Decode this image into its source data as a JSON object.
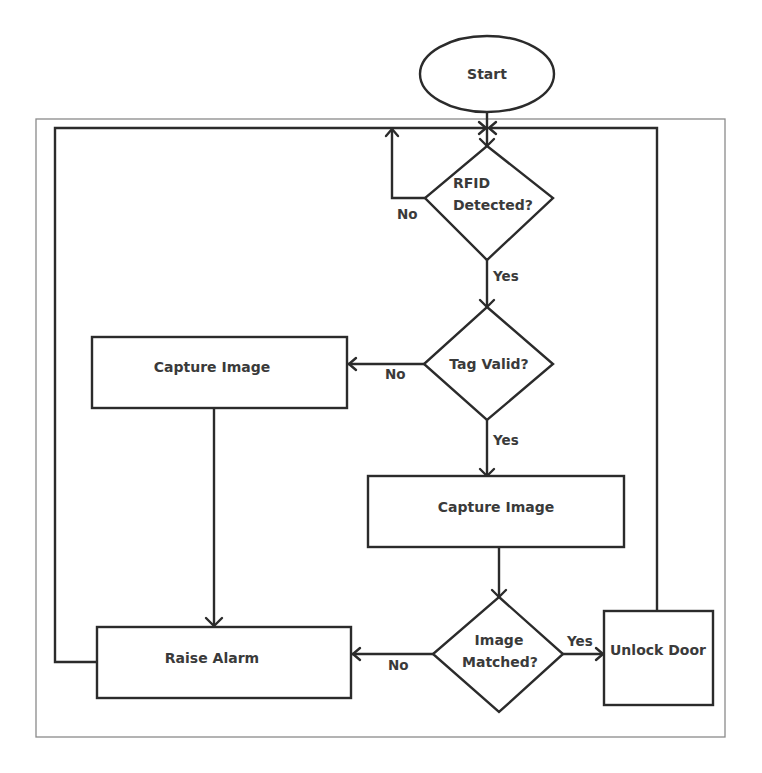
{
  "diagram": {
    "type": "flowchart",
    "nodes": [
      {
        "id": "start",
        "shape": "ellipse",
        "label": "Start"
      },
      {
        "id": "rfid",
        "shape": "diamond",
        "lines": [
          "RFID",
          "Detected?"
        ]
      },
      {
        "id": "tag",
        "shape": "diamond",
        "lines": [
          "Tag Valid?"
        ]
      },
      {
        "id": "capture_invalid",
        "shape": "rect",
        "label": "Capture Image"
      },
      {
        "id": "capture_valid",
        "shape": "rect",
        "label": "Capture Image"
      },
      {
        "id": "match",
        "shape": "diamond",
        "lines": [
          "Image",
          "Matched?"
        ]
      },
      {
        "id": "alarm",
        "shape": "rect",
        "label": "Raise Alarm"
      },
      {
        "id": "unlock",
        "shape": "rect",
        "label": "Unlock Door"
      }
    ],
    "edges": [
      {
        "from": "start",
        "to": "rfid",
        "label": ""
      },
      {
        "from": "rfid",
        "to": "rfid",
        "label": "No"
      },
      {
        "from": "rfid",
        "to": "tag",
        "label": "Yes"
      },
      {
        "from": "tag",
        "to": "capture_invalid",
        "label": "No"
      },
      {
        "from": "tag",
        "to": "capture_valid",
        "label": "Yes"
      },
      {
        "from": "capture_invalid",
        "to": "alarm",
        "label": ""
      },
      {
        "from": "capture_valid",
        "to": "match",
        "label": ""
      },
      {
        "from": "match",
        "to": "alarm",
        "label": "No"
      },
      {
        "from": "match",
        "to": "unlock",
        "label": "Yes"
      },
      {
        "from": "alarm",
        "to": "rfid",
        "label": ""
      },
      {
        "from": "unlock",
        "to": "rfid",
        "label": ""
      }
    ],
    "edge_labels": {
      "rfid_no": "No",
      "rfid_yes": "Yes",
      "tag_no": "No",
      "tag_yes": "Yes",
      "match_no": "No",
      "match_yes": "Yes"
    },
    "colors": {
      "line": "#2b2b2b",
      "text": "#3a3a3a",
      "frame": "#8a8a8a",
      "background": "#ffffff"
    }
  }
}
